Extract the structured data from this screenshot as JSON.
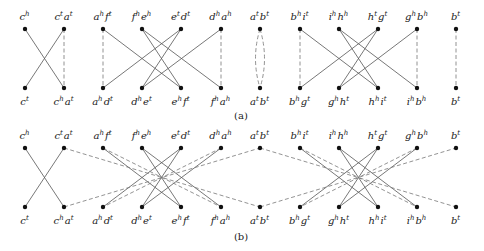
{
  "panels": [
    {
      "caption": "(a)",
      "top_nodes": [
        {
          "id": "t0",
          "label": [
            [
              "c",
              "h"
            ]
          ]
        },
        {
          "id": "t1",
          "label": [
            [
              "c",
              "t"
            ],
            [
              "a",
              "t"
            ]
          ]
        },
        {
          "id": "t2",
          "label": [
            [
              "a",
              "h"
            ],
            [
              "f",
              "t"
            ]
          ]
        },
        {
          "id": "t3",
          "label": [
            [
              "f",
              "h"
            ],
            [
              "e",
              "h"
            ]
          ]
        },
        {
          "id": "t4",
          "label": [
            [
              "e",
              "t"
            ],
            [
              "d",
              "t"
            ]
          ]
        },
        {
          "id": "t5",
          "label": [
            [
              "d",
              "h"
            ],
            [
              "a",
              "h"
            ]
          ]
        },
        {
          "id": "t6",
          "label": [
            [
              "a",
              "t"
            ],
            [
              "b",
              "t"
            ]
          ]
        },
        {
          "id": "t7",
          "label": [
            [
              "b",
              "h"
            ],
            [
              "i",
              "t"
            ]
          ]
        },
        {
          "id": "t8",
          "label": [
            [
              "i",
              "h"
            ],
            [
              "h",
              "h"
            ]
          ]
        },
        {
          "id": "t9",
          "label": [
            [
              "h",
              "t"
            ],
            [
              "g",
              "t"
            ]
          ]
        },
        {
          "id": "t10",
          "label": [
            [
              "g",
              "h"
            ],
            [
              "b",
              "h"
            ]
          ]
        },
        {
          "id": "t11",
          "label": [
            [
              "b",
              "t"
            ]
          ]
        }
      ],
      "bottom_nodes": [
        {
          "id": "b0",
          "label": [
            [
              "c",
              "t"
            ]
          ]
        },
        {
          "id": "b1",
          "label": [
            [
              "c",
              "h"
            ],
            [
              "a",
              "t"
            ]
          ]
        },
        {
          "id": "b2",
          "label": [
            [
              "a",
              "h"
            ],
            [
              "d",
              "t"
            ]
          ]
        },
        {
          "id": "b3",
          "label": [
            [
              "d",
              "h"
            ],
            [
              "e",
              "t"
            ]
          ]
        },
        {
          "id": "b4",
          "label": [
            [
              "e",
              "h"
            ],
            [
              "f",
              "t"
            ]
          ]
        },
        {
          "id": "b5",
          "label": [
            [
              "f",
              "h"
            ],
            [
              "a",
              "h"
            ]
          ]
        },
        {
          "id": "b6",
          "label": [
            [
              "a",
              "t"
            ],
            [
              "b",
              "t"
            ]
          ]
        },
        {
          "id": "b7",
          "label": [
            [
              "b",
              "h"
            ],
            [
              "g",
              "t"
            ]
          ]
        },
        {
          "id": "b8",
          "label": [
            [
              "g",
              "h"
            ],
            [
              "h",
              "t"
            ]
          ]
        },
        {
          "id": "b9",
          "label": [
            [
              "h",
              "h"
            ],
            [
              "i",
              "t"
            ]
          ]
        },
        {
          "id": "b10",
          "label": [
            [
              "i",
              "h"
            ],
            [
              "b",
              "h"
            ]
          ]
        },
        {
          "id": "b11",
          "label": [
            [
              "b",
              "t"
            ]
          ]
        }
      ],
      "solid_edges": [
        [
          "t0",
          "b1"
        ],
        [
          "t1",
          "b0"
        ],
        [
          "t2",
          "b4"
        ],
        [
          "t3",
          "b4"
        ],
        [
          "t3",
          "b5"
        ],
        [
          "t4",
          "b2"
        ],
        [
          "t4",
          "b3"
        ],
        [
          "t5",
          "b3"
        ],
        [
          "t7",
          "b9"
        ],
        [
          "t8",
          "b9"
        ],
        [
          "t8",
          "b10"
        ],
        [
          "t9",
          "b7"
        ],
        [
          "t9",
          "b8"
        ],
        [
          "t10",
          "b8"
        ]
      ],
      "dashed_edges": [
        [
          "t1",
          "b1"
        ],
        [
          "t2",
          "b2"
        ],
        [
          "t5",
          "b5"
        ],
        [
          "t7",
          "b7"
        ],
        [
          "t10",
          "b10"
        ],
        [
          "t11",
          "b11"
        ]
      ],
      "curved_dashed_edges": [
        [
          "t6",
          "b6"
        ]
      ]
    },
    {
      "caption": "(b)",
      "solid_edges": [
        [
          "t0",
          "b1"
        ],
        [
          "t1",
          "b0"
        ],
        [
          "t2",
          "b4"
        ],
        [
          "t3",
          "b4"
        ],
        [
          "t3",
          "b5"
        ],
        [
          "t4",
          "b2"
        ],
        [
          "t4",
          "b3"
        ],
        [
          "t5",
          "b3"
        ],
        [
          "t7",
          "b9"
        ],
        [
          "t8",
          "b9"
        ],
        [
          "t8",
          "b10"
        ],
        [
          "t9",
          "b7"
        ],
        [
          "t9",
          "b8"
        ],
        [
          "t10",
          "b8"
        ]
      ],
      "dashed_edges": [
        [
          "t1",
          "b6"
        ],
        [
          "b1",
          "t6"
        ],
        [
          "t2",
          "b5"
        ],
        [
          "t5",
          "b2"
        ],
        [
          "t6",
          "b11"
        ],
        [
          "b6",
          "t11"
        ],
        [
          "t7",
          "b10"
        ],
        [
          "t10",
          "b7"
        ]
      ]
    }
  ]
}
